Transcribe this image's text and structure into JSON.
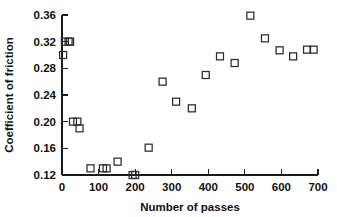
{
  "chart_data": {
    "type": "scatter",
    "title": "",
    "xlabel": "Number of passes",
    "ylabel": "Coefficient of friction",
    "xlim": [
      0,
      700
    ],
    "ylim": [
      0.12,
      0.36
    ],
    "grid": false,
    "legend": "none",
    "marker": "open-square",
    "marker_color": "#2b2b2b",
    "xticks": [
      0,
      100,
      200,
      300,
      400,
      500,
      600,
      700
    ],
    "xtick_labels": [
      "0",
      "100",
      "200",
      "300",
      "400",
      "500",
      "600",
      "700"
    ],
    "yticks": [
      0.12,
      0.16,
      0.2,
      0.24,
      0.28,
      0.32,
      0.36
    ],
    "ytick_labels": [
      "0.12",
      "0.16",
      "0.20",
      "0.24",
      "0.28",
      "0.32",
      "0.36"
    ],
    "x": [
      3,
      8,
      18,
      22,
      30,
      42,
      48,
      78,
      112,
      122,
      152,
      193,
      200,
      237,
      275,
      312,
      355,
      393,
      432,
      472,
      515,
      555,
      595,
      632,
      670,
      688
    ],
    "y": [
      0.3,
      0.32,
      0.32,
      0.32,
      0.2,
      0.2,
      0.19,
      0.13,
      0.13,
      0.13,
      0.14,
      0.12,
      0.12,
      0.161,
      0.26,
      0.23,
      0.22,
      0.27,
      0.298,
      0.288,
      0.359,
      0.325,
      0.307,
      0.298,
      0.308,
      0.308
    ],
    "points": [
      {
        "x": 3,
        "y": 0.3
      },
      {
        "x": 8,
        "y": 0.32
      },
      {
        "x": 18,
        "y": 0.32
      },
      {
        "x": 22,
        "y": 0.32
      },
      {
        "x": 30,
        "y": 0.2
      },
      {
        "x": 42,
        "y": 0.2
      },
      {
        "x": 48,
        "y": 0.19
      },
      {
        "x": 78,
        "y": 0.13
      },
      {
        "x": 112,
        "y": 0.13
      },
      {
        "x": 122,
        "y": 0.13
      },
      {
        "x": 152,
        "y": 0.14
      },
      {
        "x": 193,
        "y": 0.12
      },
      {
        "x": 200,
        "y": 0.12
      },
      {
        "x": 237,
        "y": 0.161
      },
      {
        "x": 275,
        "y": 0.26
      },
      {
        "x": 312,
        "y": 0.23
      },
      {
        "x": 355,
        "y": 0.22
      },
      {
        "x": 393,
        "y": 0.27
      },
      {
        "x": 432,
        "y": 0.298
      },
      {
        "x": 472,
        "y": 0.288
      },
      {
        "x": 515,
        "y": 0.359
      },
      {
        "x": 555,
        "y": 0.325
      },
      {
        "x": 595,
        "y": 0.307
      },
      {
        "x": 632,
        "y": 0.298
      },
      {
        "x": 670,
        "y": 0.308
      },
      {
        "x": 688,
        "y": 0.308
      }
    ]
  }
}
